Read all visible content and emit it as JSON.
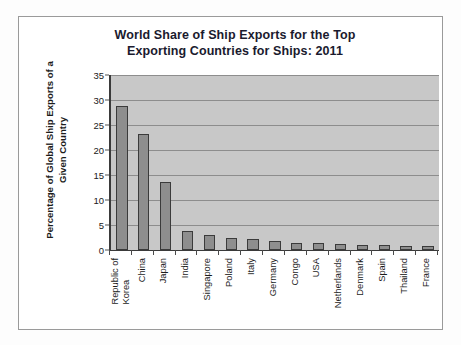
{
  "chart_data": {
    "type": "bar",
    "title": "World Share of Ship Exports for the Top Exporting Countries for Ships: 2011",
    "title_lines": [
      "World Share of Ship Exports for the Top",
      "Exporting Countries for Ships: 2011"
    ],
    "xlabel": "",
    "ylabel": "Percentage of Global Ship Exports of a Given Country",
    "ylabel_lines": [
      "Percentage of Global Ship Exports of a",
      "Given Country"
    ],
    "ylim": [
      0,
      35
    ],
    "ytick_values": [
      0,
      5,
      10,
      15,
      20,
      25,
      30,
      35
    ],
    "ytick_labels": [
      "0",
      "5",
      "10",
      "15",
      "20",
      "25",
      "30",
      "35"
    ],
    "grid": true,
    "legend": false,
    "categories": [
      "Republic of Korea",
      "China",
      "Japan",
      "India",
      "Singapore",
      "Poland",
      "Italy",
      "Germany",
      "Congo",
      "USA",
      "Netherlands",
      "Denmark",
      "Spain",
      "Thailand",
      "France"
    ],
    "category_label_lines": [
      [
        "Republic of",
        "Korea"
      ],
      [
        "China"
      ],
      [
        "Japan"
      ],
      [
        "India"
      ],
      [
        "Singapore"
      ],
      [
        "Poland"
      ],
      [
        "Italy"
      ],
      [
        "Germany"
      ],
      [
        "Congo"
      ],
      [
        "USA"
      ],
      [
        "Netherlands"
      ],
      [
        "Denmark"
      ],
      [
        "Spain"
      ],
      [
        "Thailand"
      ],
      [
        "France"
      ]
    ],
    "values": [
      28.8,
      23.3,
      13.7,
      3.8,
      3.0,
      2.5,
      2.3,
      1.9,
      1.5,
      1.4,
      1.2,
      1.1,
      1.0,
      0.9,
      0.8
    ],
    "bar_color": "#8e8e8e",
    "bar_edge_color": "#3b3b3b",
    "plot_background": "#c8c8c8",
    "gridline_color": "#8d8d8d",
    "axis_color": "#3a3a3a"
  }
}
